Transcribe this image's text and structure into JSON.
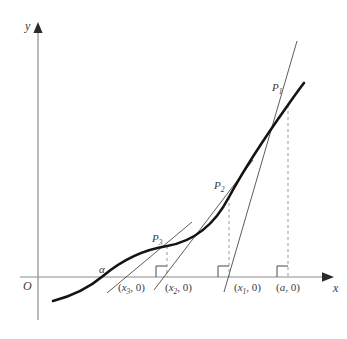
{
  "figure": {
    "axes": {
      "y_label": "y",
      "x_label": "x",
      "origin_label": "O",
      "axis_color": "#808080",
      "axis_x_y": 277,
      "axis_y_x": 38
    },
    "curve": {
      "color": "#1a1a1a",
      "width": 2.6,
      "root_label": "α",
      "description": "increasing convex curve crossing the x-axis at alpha"
    },
    "tangent_lines": {
      "color": "#4a4a4a",
      "width": 0.9,
      "count": 3
    },
    "dashed_lines": {
      "color": "#9a9a9a",
      "width": 1,
      "dash": "3,3"
    },
    "points": [
      {
        "label": "P",
        "sub": "1",
        "x": 288,
        "y": 105,
        "label_x": 272,
        "label_y": 82
      },
      {
        "label": "P",
        "sub": "2",
        "x": 229,
        "y": 197,
        "label_x": 214,
        "label_y": 180
      },
      {
        "label": "P",
        "sub": "3",
        "x": 167,
        "y": 246,
        "label_x": 152,
        "label_y": 233
      }
    ],
    "x_ticks": [
      {
        "text_open": "(",
        "var": "x",
        "sub": "3",
        "text_close": ", 0)",
        "label": "(x₃, 0)",
        "x": 113,
        "label_x": 118,
        "label_y": 284
      },
      {
        "text_open": "(",
        "var": "x",
        "sub": "2",
        "text_close": ", 0)",
        "label": "(x₂, 0)",
        "x": 160,
        "label_x": 165,
        "label_y": 284
      },
      {
        "text_open": "(",
        "var": "x",
        "sub": "1",
        "text_close": ", 0)",
        "label": "(x₁, 0)",
        "x": 229,
        "label_x": 234,
        "label_y": 284
      },
      {
        "text_open": "(",
        "var": "a",
        "sub": "",
        "text_close": ", 0)",
        "label": "(a, 0)",
        "x": 288,
        "label_x": 276,
        "label_y": 284
      }
    ],
    "right_angle_marks": [
      {
        "x": 167,
        "y": 277
      },
      {
        "x": 229,
        "y": 277
      },
      {
        "x": 288,
        "y": 277
      }
    ],
    "alpha": {
      "label": "α",
      "x": 99,
      "y": 265
    }
  }
}
